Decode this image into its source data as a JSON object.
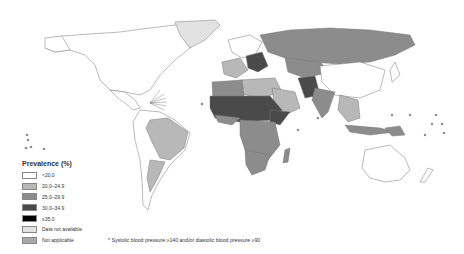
{
  "legend": {
    "title": "Prevalence (%)",
    "items": [
      {
        "label": "<20.0",
        "color": "#ffffff"
      },
      {
        "label": "20.0–24.9",
        "color": "#b8b8b8"
      },
      {
        "label": "25.0–29.9",
        "color": "#8c8c8c"
      },
      {
        "label": "30.0–34.9",
        "color": "#4a4a4a"
      },
      {
        "label": "≥35.0",
        "color": "#000000"
      },
      {
        "label": "Data not available",
        "color": "#e2e2e2"
      },
      {
        "label": "Not applicable",
        "color": "#a8a8a8"
      }
    ]
  },
  "footnote": "* Systolic blood pressure ≥140 and/or diastolic blood pressure ≥90",
  "colors": {
    "land_low": "#ffffff",
    "border": "#777777",
    "c20": "#b8b8b8",
    "c25": "#8c8c8c",
    "c30": "#4a4a4a",
    "c35": "#000000",
    "na": "#e2e2e2"
  }
}
